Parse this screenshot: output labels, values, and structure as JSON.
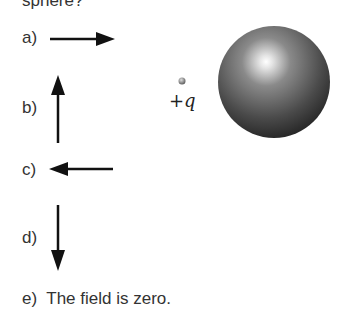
{
  "question": {
    "stem_fragment": "sphere?"
  },
  "figure": {
    "charge_label": "+q",
    "sphere": "conducting-sphere"
  },
  "options": [
    {
      "label": "a)",
      "direction": "right"
    },
    {
      "label": "b)",
      "direction": "up"
    },
    {
      "label": "c)",
      "direction": "left"
    },
    {
      "label": "d)",
      "direction": "down"
    },
    {
      "label": "e)",
      "text": "The field is zero."
    }
  ]
}
